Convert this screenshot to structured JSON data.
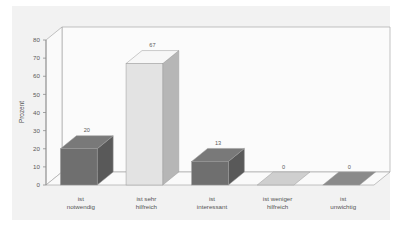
{
  "chart_data": {
    "type": "bar",
    "title": "",
    "xlabel": "",
    "ylabel": "Prozent",
    "ylim": [
      0,
      80
    ],
    "ytick_step": 10,
    "yticks": [
      "0",
      "10",
      "20",
      "30",
      "40",
      "50",
      "60",
      "70",
      "80"
    ],
    "grid": false,
    "legend": "none",
    "style": "3d-bar",
    "categories": [
      "ist notwendig",
      "ist sehr hilfreich",
      "ist interessant",
      "ist weniger hilfreich",
      "ist unwichtig"
    ],
    "category_lines": [
      [
        "ist",
        "notwendig"
      ],
      [
        "ist sehr",
        "hilfreich"
      ],
      [
        "ist",
        "interessant"
      ],
      [
        "ist weniger",
        "hilfreich"
      ],
      [
        "ist",
        "unwichtig"
      ]
    ],
    "values": [
      20,
      67,
      13,
      0,
      0
    ],
    "value_labels": [
      "20",
      "67",
      "13",
      "0",
      "0"
    ],
    "bar_colors": [
      "#6f6f6f",
      "#e3e3e3",
      "#6f6f6f",
      "#cfcfcf",
      "#8a8a8a"
    ]
  },
  "colors": {
    "panel_background": "#f2f2f2",
    "plot_background": "#fbfbfb",
    "axis_line": "#8d8d8d",
    "frame_line": "#a9a9a9",
    "text": "#555555",
    "bar_dark": "#6f6f6f",
    "bar_light": "#e3e3e3"
  }
}
